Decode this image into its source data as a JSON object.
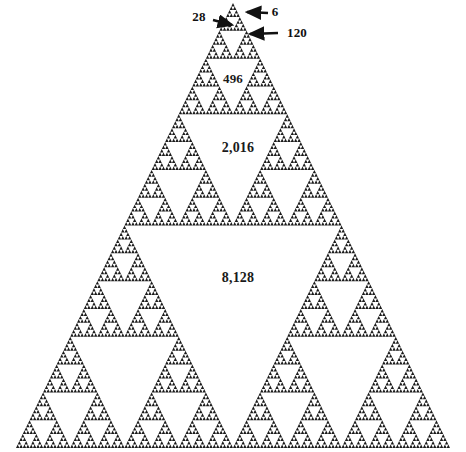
{
  "figure": {
    "type": "sierpinski-triangle",
    "title": "",
    "background_color": "#ffffff",
    "ink_color": "#1c1c1c",
    "width": 466,
    "height": 452,
    "recursion_depth": 7,
    "apex": {
      "x": 233,
      "y": 3
    },
    "base_left": {
      "x": 16,
      "y": 448
    },
    "base_right": {
      "x": 450,
      "y": 448
    }
  },
  "labels": {
    "inside": [
      {
        "id": "label-496",
        "text": "496",
        "x": 233,
        "y": 79,
        "font_size": 13,
        "level": 4,
        "note": "fourth-level central hole"
      },
      {
        "id": "label-2016",
        "text": "2,016",
        "x": 238,
        "y": 148,
        "font_size": 14,
        "level": 5,
        "note": "fifth-level central hole"
      },
      {
        "id": "label-8128",
        "text": "8,128",
        "x": 238,
        "y": 278,
        "font_size": 14,
        "level": 6,
        "note": "largest central hole"
      }
    ],
    "callouts": [
      {
        "id": "callout-28",
        "text": "28",
        "text_x": 199,
        "text_y": 17,
        "font_size": 13,
        "arrow": {
          "x1": 213,
          "y1": 20,
          "x2": 232,
          "y2": 25
        },
        "side": "left",
        "note": "points at second-level hole"
      },
      {
        "id": "callout-6",
        "text": "6",
        "text_x": 275,
        "text_y": 12,
        "font_size": 13,
        "arrow": {
          "x1": 268,
          "y1": 13,
          "x2": 247,
          "y2": 12
        },
        "side": "right",
        "note": "points at smallest apex hole"
      },
      {
        "id": "callout-120",
        "text": "120",
        "text_x": 297,
        "text_y": 33,
        "font_size": 13,
        "arrow": {
          "x1": 278,
          "y1": 33,
          "x2": 250,
          "y2": 34
        },
        "side": "right",
        "note": "points at third-level hole"
      }
    ]
  },
  "sequence": {
    "name": "perfect and triangular numbers",
    "values": [
      6,
      28,
      120,
      496,
      2016,
      8128
    ],
    "display": [
      "6",
      "28",
      "120",
      "496",
      "2,016",
      "8,128"
    ]
  }
}
